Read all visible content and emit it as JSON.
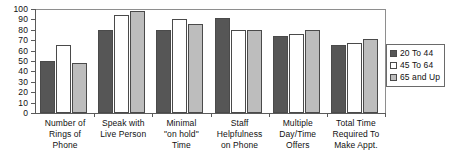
{
  "chart_data": {
    "type": "bar",
    "title": "",
    "subtitle": "",
    "xlabel": "",
    "ylabel": "",
    "ylim": [
      0,
      100
    ],
    "ytick_interval": 10,
    "yticks": [
      0,
      10,
      20,
      30,
      40,
      50,
      60,
      70,
      80,
      90,
      100
    ],
    "ytick_labels": [
      "0",
      "10",
      "20",
      "30",
      "40",
      "50",
      "60",
      "70",
      "80",
      "90",
      "100"
    ],
    "grid": false,
    "legend_position": "right",
    "categories": [
      "Number of\nRings of\nPhone",
      "Speak with\nLive Person",
      "Minimal\n\"on hold\"\nTime",
      "Staff\nHelpfulness\non Phone",
      "Multiple\nDay/Time\nOffers",
      "Total Time\nRequired To\nMake Appt."
    ],
    "category_lines": [
      [
        "Number of",
        "Rings of",
        "Phone"
      ],
      [
        "Speak with",
        "Live Person"
      ],
      [
        "Minimal",
        "\"on hold\"",
        "Time"
      ],
      [
        "Staff",
        "Helpfulness",
        "on Phone"
      ],
      [
        "Multiple",
        "Day/Time",
        "Offers"
      ],
      [
        "Total Time",
        "Required To",
        "Make Appt."
      ]
    ],
    "series": [
      {
        "name": "20 To 44",
        "color": "#565656",
        "values": [
          50,
          80,
          80,
          91,
          74,
          65
        ]
      },
      {
        "name": "45 To 64",
        "color": "#ffffff",
        "values": [
          65,
          94,
          90,
          80,
          76,
          67
        ]
      },
      {
        "name": "65 and Up",
        "color": "#bdbdbd",
        "values": [
          48,
          98,
          86,
          80,
          80,
          71
        ]
      }
    ]
  },
  "legend": {
    "items": [
      {
        "label": "20 To 44",
        "swatch": "dark-gray-swatch"
      },
      {
        "label": "45 To 64",
        "swatch": "white-swatch"
      },
      {
        "label": "65 and Up",
        "swatch": "light-gray-swatch"
      }
    ]
  }
}
